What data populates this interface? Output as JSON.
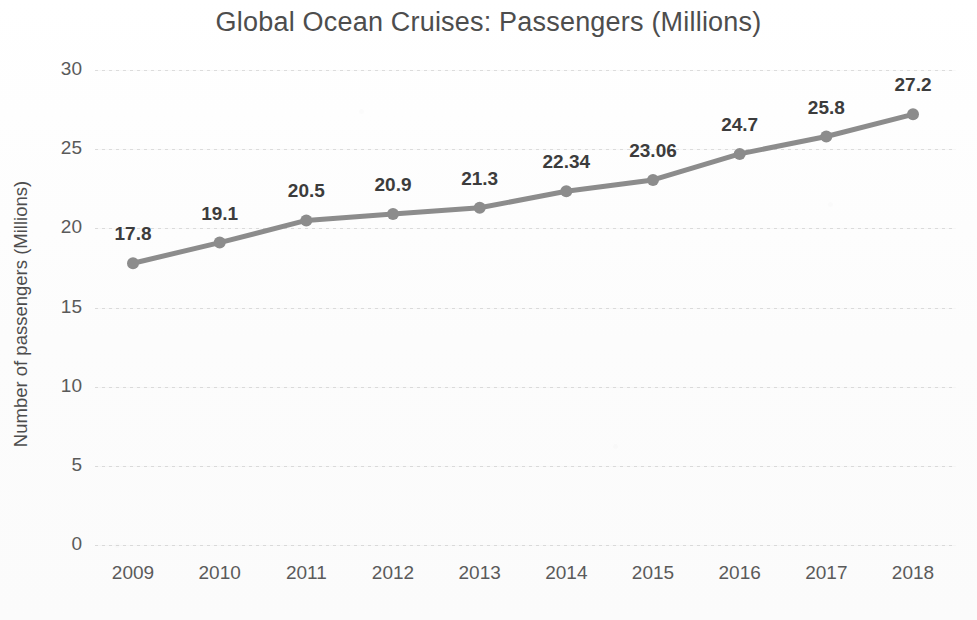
{
  "chart_data": {
    "type": "line",
    "title": "Global Ocean Cruises: Passengers (Millions)",
    "xlabel": "",
    "ylabel": "Number of passengers (Millions)",
    "categories": [
      "2009",
      "2010",
      "2011",
      "2012",
      "2013",
      "2014",
      "2015",
      "2016",
      "2017",
      "2018"
    ],
    "values": [
      17.8,
      19.1,
      20.5,
      20.9,
      21.3,
      22.34,
      23.06,
      24.7,
      25.8,
      27.2
    ],
    "point_labels": [
      "17.8",
      "19.1",
      "20.5",
      "20.9",
      "21.3",
      "22.34",
      "23.06",
      "24.7",
      "25.8",
      "27.2"
    ],
    "ylim": [
      0,
      30
    ],
    "y_ticks": [
      0,
      5,
      10,
      15,
      20,
      25,
      30
    ],
    "y_tick_labels": [
      "0",
      "5",
      "10",
      "15",
      "20",
      "25",
      "30"
    ],
    "grid": true,
    "grid_axis": "y",
    "legend": false,
    "legend_position": "none",
    "series": [
      {
        "name": "Passengers (Millions)",
        "values": [
          17.8,
          19.1,
          20.5,
          20.9,
          21.3,
          22.34,
          23.06,
          24.7,
          25.8,
          27.2
        ],
        "line_color": "#8c8c8c",
        "marker_color": "#8c8c8c",
        "marker": "circle"
      }
    ],
    "colors": {
      "line": "#8c8c8c",
      "marker": "#8c8c8c",
      "gridline": "#bfbfbf",
      "title_text": "#4d4d4d",
      "tick_text": "#5a5a5a",
      "data_label_text": "#3c3c3c",
      "background": "#fdfdfd"
    }
  }
}
